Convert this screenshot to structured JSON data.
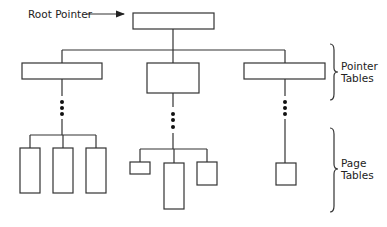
{
  "diagram": {
    "root_label": "Root Pointer",
    "pointer_tables_label_line1": "Pointer",
    "pointer_tables_label_line2": "Tables",
    "page_tables_label_line1": "Page",
    "page_tables_label_line2": "Tables",
    "stroke_color": "#333333",
    "levels": [
      {
        "name": "root",
        "nodes": 1
      },
      {
        "name": "pointer-tables",
        "nodes": 3
      },
      {
        "name": "page-tables",
        "groups": [
          3,
          3,
          1
        ]
      }
    ]
  }
}
